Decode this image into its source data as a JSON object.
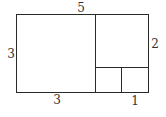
{
  "diagram": {
    "stroke_color": "#2a2a2a",
    "label_color": "#333333",
    "labels": {
      "top": "5",
      "left": "3",
      "right": "2",
      "bottom_left": "3",
      "bottom_right": "1"
    },
    "regions": [
      {
        "name": "large-square",
        "side": "3"
      },
      {
        "name": "medium-square",
        "side": "2"
      },
      {
        "name": "small-square-left",
        "side": "1"
      },
      {
        "name": "small-square-right",
        "side": "1"
      }
    ]
  }
}
